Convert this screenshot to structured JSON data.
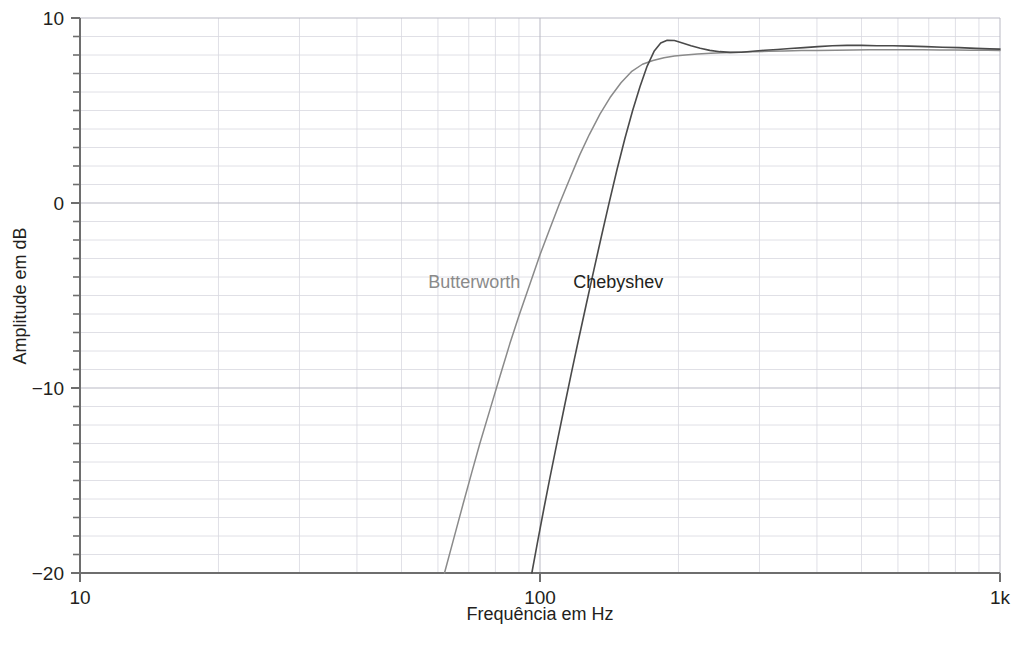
{
  "chart_data": {
    "type": "line",
    "title": "",
    "subtitle": "",
    "xlabel": "Frequência em Hz",
    "ylabel": "Amplitude em dB",
    "xscale": "log",
    "yscale": "linear",
    "xlim": [
      10,
      1000
    ],
    "ylim": [
      -20,
      10
    ],
    "grid": true,
    "grid_minor": true,
    "y_tick_step_major": 10,
    "y_tick_step_minor": 1,
    "legend_position": "inline-annotation",
    "x_ticks": [
      {
        "value": 10,
        "label": "10"
      },
      {
        "value": 100,
        "label": "100"
      },
      {
        "value": 1000,
        "label": "1k"
      }
    ],
    "y_ticks": [
      {
        "value": 10,
        "label": "10"
      },
      {
        "value": 0,
        "label": "0"
      },
      {
        "value": -10,
        "label": "−10"
      },
      {
        "value": -20,
        "label": "−20"
      }
    ],
    "colors": {
      "butterworth": "#8a8a8a",
      "chebyshev": "#4a4a4a",
      "axis": "#6e6e6e",
      "grid_major": "#b9b9c4",
      "grid_minor": "#d8d8e0",
      "text": "#231f20",
      "background": "#ffffff"
    },
    "annotations": [
      {
        "name": "butterworth-label",
        "text": "Butterworth",
        "x": 72,
        "y": -4.6,
        "color": "#8a8a8a"
      },
      {
        "name": "chebyshev-label",
        "text": "Chebyshev",
        "x": 148,
        "y": -4.6,
        "color": "#231f20"
      }
    ],
    "series": [
      {
        "name": "Butterworth",
        "color": "#8a8a8a",
        "width": 1.5,
        "points": [
          [
            62,
            -20.0
          ],
          [
            65,
            -18.1
          ],
          [
            68,
            -16.3
          ],
          [
            71,
            -14.6
          ],
          [
            74,
            -13.0
          ],
          [
            78,
            -11.1
          ],
          [
            82,
            -9.3
          ],
          [
            86,
            -7.6
          ],
          [
            90,
            -6.1
          ],
          [
            95,
            -4.4
          ],
          [
            100,
            -2.8
          ],
          [
            105,
            -1.4
          ],
          [
            110,
            -0.1
          ],
          [
            116,
            1.3
          ],
          [
            122,
            2.6
          ],
          [
            128,
            3.7
          ],
          [
            135,
            4.8
          ],
          [
            142,
            5.7
          ],
          [
            150,
            6.5
          ],
          [
            158,
            7.1
          ],
          [
            167,
            7.5
          ],
          [
            176,
            7.7
          ],
          [
            186,
            7.85
          ],
          [
            196,
            7.95
          ],
          [
            207,
            8.0
          ],
          [
            220,
            8.05
          ],
          [
            235,
            8.1
          ],
          [
            250,
            8.12
          ],
          [
            270,
            8.15
          ],
          [
            290,
            8.18
          ],
          [
            315,
            8.2
          ],
          [
            340,
            8.22
          ],
          [
            370,
            8.24
          ],
          [
            400,
            8.25
          ],
          [
            440,
            8.26
          ],
          [
            480,
            8.27
          ],
          [
            520,
            8.28
          ],
          [
            570,
            8.28
          ],
          [
            620,
            8.28
          ],
          [
            680,
            8.28
          ],
          [
            740,
            8.27
          ],
          [
            800,
            8.27
          ],
          [
            870,
            8.26
          ],
          [
            940,
            8.26
          ],
          [
            1000,
            8.25
          ]
        ]
      },
      {
        "name": "Chebyshev",
        "color": "#4a4a4a",
        "width": 1.6,
        "points": [
          [
            96,
            -20.0
          ],
          [
            99,
            -18.2
          ],
          [
            102,
            -16.5
          ],
          [
            105,
            -14.9
          ],
          [
            109,
            -12.9
          ],
          [
            113,
            -11.0
          ],
          [
            117,
            -9.2
          ],
          [
            121,
            -7.5
          ],
          [
            126,
            -5.5
          ],
          [
            131,
            -3.6
          ],
          [
            136,
            -1.8
          ],
          [
            141,
            -0.1
          ],
          [
            147,
            1.8
          ],
          [
            153,
            3.5
          ],
          [
            159,
            5.0
          ],
          [
            165,
            6.3
          ],
          [
            171,
            7.4
          ],
          [
            177,
            8.2
          ],
          [
            183,
            8.65
          ],
          [
            189,
            8.8
          ],
          [
            196,
            8.78
          ],
          [
            204,
            8.65
          ],
          [
            213,
            8.5
          ],
          [
            223,
            8.36
          ],
          [
            234,
            8.25
          ],
          [
            246,
            8.18
          ],
          [
            259,
            8.14
          ],
          [
            274,
            8.15
          ],
          [
            290,
            8.2
          ],
          [
            308,
            8.26
          ],
          [
            328,
            8.3
          ],
          [
            350,
            8.35
          ],
          [
            375,
            8.4
          ],
          [
            402,
            8.45
          ],
          [
            432,
            8.5
          ],
          [
            465,
            8.52
          ],
          [
            500,
            8.52
          ],
          [
            540,
            8.5
          ],
          [
            585,
            8.5
          ],
          [
            635,
            8.48
          ],
          [
            690,
            8.45
          ],
          [
            750,
            8.42
          ],
          [
            815,
            8.4
          ],
          [
            885,
            8.36
          ],
          [
            950,
            8.33
          ],
          [
            1000,
            8.32
          ]
        ]
      }
    ]
  }
}
